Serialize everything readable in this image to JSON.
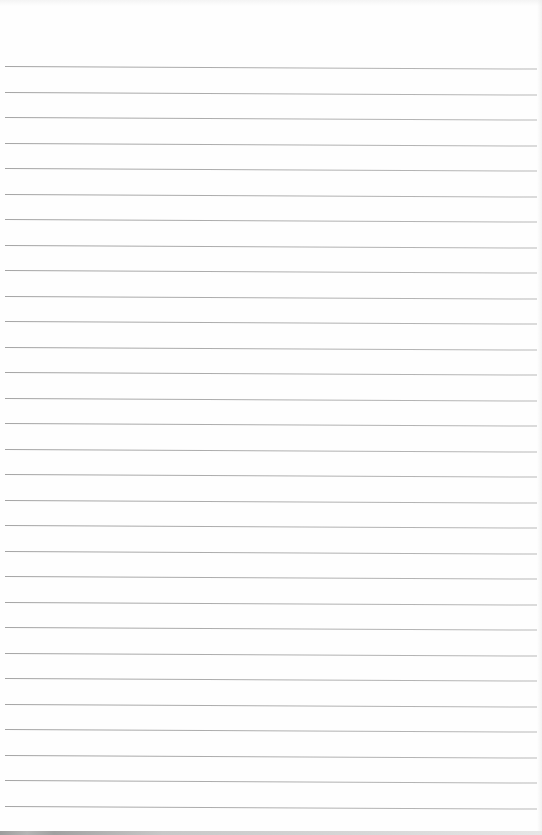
{
  "document": {
    "type": "lined-paper",
    "text": "",
    "rules": {
      "count": 30,
      "first_y": 66,
      "spacing": 25.5,
      "left": 5,
      "right": 537,
      "color": "#a3a3a3"
    },
    "background_color": "#ffffff",
    "bottom_strip_color": "#b0b0b0"
  }
}
